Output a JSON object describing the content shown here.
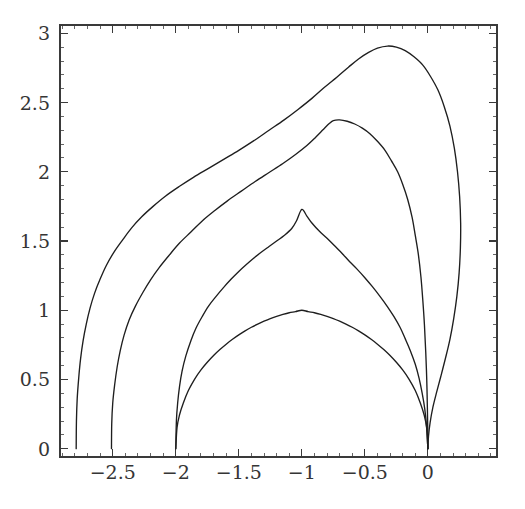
{
  "figure": {
    "background_color": "#ffffff",
    "line_color": "#1e1e1e",
    "axis_color": "#3a3a3a",
    "label_color": "#353535",
    "width": 525,
    "height": 509
  },
  "axes": {
    "frame": {
      "left_px": 60,
      "right_px": 497,
      "top_px": 25,
      "bottom_px": 457
    },
    "x_label_text": "",
    "y_label_text": "",
    "x_major_ticks": [
      -2.5,
      -2,
      -1.5,
      -1,
      -0.5,
      0
    ],
    "x_major_tick_labels": [
      "-2.5",
      "-2",
      "-1.5",
      "-1",
      "-0.5",
      "0"
    ],
    "y_major_ticks": [
      0,
      0.5,
      1,
      1.5,
      2,
      2.5,
      3
    ],
    "y_major_tick_labels": [
      "0",
      "0.5",
      "1",
      "1.5",
      "2",
      "2.5",
      "3"
    ],
    "x_minor_step": 0.1,
    "y_minor_step": 0.1,
    "grid": false
  },
  "chart_data": {
    "type": "line",
    "title": "",
    "subtitle": "",
    "xlabel": "",
    "ylabel": "",
    "xlim": [
      -2.79,
      0.42
    ],
    "ylim": [
      0,
      3.0
    ],
    "grid": false,
    "legend": null,
    "legend_position": "none",
    "annotations": [],
    "x_tick_labels": [
      "-2.5",
      "-2",
      "-1.5",
      "-1",
      "-0.5",
      "0"
    ],
    "y_tick_labels": [
      "0",
      "0.5",
      "1",
      "1.5",
      "2",
      "2.5",
      "3"
    ],
    "series": [
      {
        "name": "curve-1-inner",
        "peak_x": -1.0,
        "peak_y": 1.0,
        "x_start": -2.0,
        "x_end": 0.0,
        "points": [
          [
            -2.0,
            0.0
          ],
          [
            -1.99,
            0.152
          ],
          [
            -1.97,
            0.245
          ],
          [
            -1.94,
            0.33
          ],
          [
            -1.9,
            0.42
          ],
          [
            -1.85,
            0.503
          ],
          [
            -1.8,
            0.569
          ],
          [
            -1.75,
            0.624
          ],
          [
            -1.7,
            0.673
          ],
          [
            -1.65,
            0.716
          ],
          [
            -1.6,
            0.755
          ],
          [
            -1.55,
            0.79
          ],
          [
            -1.5,
            0.822
          ],
          [
            -1.45,
            0.851
          ],
          [
            -1.4,
            0.877
          ],
          [
            -1.35,
            0.9
          ],
          [
            -1.3,
            0.921
          ],
          [
            -1.25,
            0.94
          ],
          [
            -1.2,
            0.956
          ],
          [
            -1.15,
            0.97
          ],
          [
            -1.1,
            0.982
          ],
          [
            -1.05,
            0.99
          ],
          [
            -1.0,
            1.0
          ],
          [
            -0.95,
            0.99
          ],
          [
            -0.9,
            0.982
          ],
          [
            -0.85,
            0.97
          ],
          [
            -0.8,
            0.956
          ],
          [
            -0.75,
            0.94
          ],
          [
            -0.7,
            0.921
          ],
          [
            -0.65,
            0.9
          ],
          [
            -0.6,
            0.877
          ],
          [
            -0.55,
            0.851
          ],
          [
            -0.5,
            0.822
          ],
          [
            -0.45,
            0.79
          ],
          [
            -0.4,
            0.755
          ],
          [
            -0.35,
            0.716
          ],
          [
            -0.3,
            0.673
          ],
          [
            -0.25,
            0.624
          ],
          [
            -0.2,
            0.569
          ],
          [
            -0.15,
            0.503
          ],
          [
            -0.1,
            0.42
          ],
          [
            -0.06,
            0.33
          ],
          [
            -0.03,
            0.245
          ],
          [
            -0.01,
            0.152
          ],
          [
            0.0,
            0.0
          ]
        ]
      },
      {
        "name": "curve-2",
        "peak_x": -1.0,
        "peak_y": 1.732,
        "x_start": -2.0,
        "x_end": 0.0,
        "points": [
          [
            -2.0,
            0.0
          ],
          [
            -1.995,
            0.2
          ],
          [
            -1.985,
            0.33
          ],
          [
            -1.97,
            0.45
          ],
          [
            -1.95,
            0.56
          ],
          [
            -1.92,
            0.67
          ],
          [
            -1.88,
            0.78
          ],
          [
            -1.84,
            0.87
          ],
          [
            -1.79,
            0.955
          ],
          [
            -1.74,
            1.03
          ],
          [
            -1.68,
            1.1
          ],
          [
            -1.62,
            1.165
          ],
          [
            -1.56,
            1.225
          ],
          [
            -1.5,
            1.28
          ],
          [
            -1.44,
            1.33
          ],
          [
            -1.38,
            1.377
          ],
          [
            -1.32,
            1.42
          ],
          [
            -1.26,
            1.46
          ],
          [
            -1.2,
            1.5
          ],
          [
            -1.14,
            1.54
          ],
          [
            -1.08,
            1.59
          ],
          [
            -1.04,
            1.65
          ],
          [
            -1.0,
            1.728
          ],
          [
            -0.96,
            1.68
          ],
          [
            -0.92,
            1.63
          ],
          [
            -0.86,
            1.57
          ],
          [
            -0.8,
            1.52
          ],
          [
            -0.74,
            1.465
          ],
          [
            -0.68,
            1.41
          ],
          [
            -0.62,
            1.35
          ],
          [
            -0.56,
            1.295
          ],
          [
            -0.5,
            1.235
          ],
          [
            -0.44,
            1.17
          ],
          [
            -0.38,
            1.1
          ],
          [
            -0.32,
            1.025
          ],
          [
            -0.27,
            0.955
          ],
          [
            -0.22,
            0.875
          ],
          [
            -0.18,
            0.795
          ],
          [
            -0.14,
            0.71
          ],
          [
            -0.1,
            0.61
          ],
          [
            -0.07,
            0.51
          ],
          [
            -0.045,
            0.4
          ],
          [
            -0.025,
            0.29
          ],
          [
            -0.01,
            0.16
          ],
          [
            0.0,
            0.0
          ]
        ]
      },
      {
        "name": "curve-3",
        "peak_x": -0.75,
        "peak_y": 2.37,
        "x_start": -2.51,
        "x_end": 0.0,
        "points": [
          [
            -2.51,
            0.0
          ],
          [
            -2.508,
            0.18
          ],
          [
            -2.5,
            0.33
          ],
          [
            -2.485,
            0.46
          ],
          [
            -2.465,
            0.59
          ],
          [
            -2.44,
            0.71
          ],
          [
            -2.41,
            0.82
          ],
          [
            -2.37,
            0.93
          ],
          [
            -2.32,
            1.03
          ],
          [
            -2.26,
            1.13
          ],
          [
            -2.2,
            1.22
          ],
          [
            -2.13,
            1.31
          ],
          [
            -2.05,
            1.4
          ],
          [
            -1.97,
            1.485
          ],
          [
            -1.88,
            1.565
          ],
          [
            -1.79,
            1.645
          ],
          [
            -1.69,
            1.72
          ],
          [
            -1.59,
            1.79
          ],
          [
            -1.48,
            1.86
          ],
          [
            -1.37,
            1.93
          ],
          [
            -1.26,
            1.995
          ],
          [
            -1.15,
            2.06
          ],
          [
            -1.05,
            2.125
          ],
          [
            -0.96,
            2.19
          ],
          [
            -0.89,
            2.25
          ],
          [
            -0.83,
            2.305
          ],
          [
            -0.78,
            2.35
          ],
          [
            -0.75,
            2.37
          ],
          [
            -0.7,
            2.375
          ],
          [
            -0.64,
            2.365
          ],
          [
            -0.58,
            2.345
          ],
          [
            -0.52,
            2.315
          ],
          [
            -0.46,
            2.275
          ],
          [
            -0.4,
            2.22
          ],
          [
            -0.34,
            2.155
          ],
          [
            -0.29,
            2.08
          ],
          [
            -0.24,
            2.0
          ],
          [
            -0.2,
            1.91
          ],
          [
            -0.16,
            1.8
          ],
          [
            -0.125,
            1.67
          ],
          [
            -0.1,
            1.54
          ],
          [
            -0.075,
            1.4
          ],
          [
            -0.055,
            1.24
          ],
          [
            -0.04,
            1.07
          ],
          [
            -0.027,
            0.89
          ],
          [
            -0.017,
            0.7
          ],
          [
            -0.009,
            0.5
          ],
          [
            -0.004,
            0.3
          ],
          [
            -0.001,
            0.14
          ],
          [
            0.0,
            0.0
          ]
        ]
      },
      {
        "name": "curve-4-outer",
        "peak_x": -0.32,
        "peak_y": 2.91,
        "x_start": -2.79,
        "x_end": 0.0,
        "rightmost_x": 0.26,
        "points": [
          [
            -2.79,
            0.0
          ],
          [
            -2.788,
            0.2
          ],
          [
            -2.782,
            0.36
          ],
          [
            -2.77,
            0.51
          ],
          [
            -2.755,
            0.65
          ],
          [
            -2.735,
            0.78
          ],
          [
            -2.71,
            0.9
          ],
          [
            -2.68,
            1.015
          ],
          [
            -2.645,
            1.12
          ],
          [
            -2.6,
            1.225
          ],
          [
            -2.55,
            1.325
          ],
          [
            -2.49,
            1.42
          ],
          [
            -2.42,
            1.51
          ],
          [
            -2.35,
            1.595
          ],
          [
            -2.27,
            1.675
          ],
          [
            -2.18,
            1.75
          ],
          [
            -2.08,
            1.825
          ],
          [
            -1.97,
            1.895
          ],
          [
            -1.86,
            1.96
          ],
          [
            -1.74,
            2.025
          ],
          [
            -1.62,
            2.09
          ],
          [
            -1.5,
            2.155
          ],
          [
            -1.38,
            2.225
          ],
          [
            -1.26,
            2.3
          ],
          [
            -1.14,
            2.375
          ],
          [
            -1.03,
            2.45
          ],
          [
            -0.92,
            2.53
          ],
          [
            -0.82,
            2.61
          ],
          [
            -0.72,
            2.685
          ],
          [
            -0.63,
            2.755
          ],
          [
            -0.55,
            2.815
          ],
          [
            -0.47,
            2.862
          ],
          [
            -0.4,
            2.893
          ],
          [
            -0.32,
            2.908
          ],
          [
            -0.25,
            2.9
          ],
          [
            -0.18,
            2.875
          ],
          [
            -0.11,
            2.83
          ],
          [
            -0.04,
            2.77
          ],
          [
            0.02,
            2.69
          ],
          [
            0.08,
            2.59
          ],
          [
            0.13,
            2.47
          ],
          [
            0.175,
            2.33
          ],
          [
            0.21,
            2.17
          ],
          [
            0.235,
            2.0
          ],
          [
            0.252,
            1.82
          ],
          [
            0.26,
            1.63
          ],
          [
            0.258,
            1.45
          ],
          [
            0.248,
            1.27
          ],
          [
            0.23,
            1.1
          ],
          [
            0.205,
            0.94
          ],
          [
            0.175,
            0.79
          ],
          [
            0.14,
            0.655
          ],
          [
            0.105,
            0.53
          ],
          [
            0.07,
            0.41
          ],
          [
            0.04,
            0.3
          ],
          [
            0.018,
            0.19
          ],
          [
            0.005,
            0.09
          ],
          [
            0.0,
            0.0
          ]
        ]
      }
    ]
  }
}
